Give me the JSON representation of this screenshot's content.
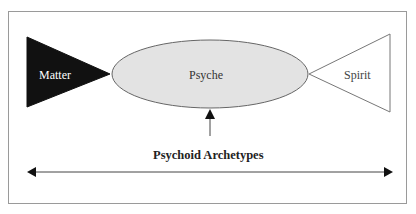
{
  "diagram": {
    "nodes": {
      "matter": {
        "label": "Matter",
        "shape": "triangle-right-pointing",
        "fill": "#111111"
      },
      "psyche": {
        "label": "Psyche",
        "shape": "ellipse",
        "fill": "#e3e3e3"
      },
      "spirit": {
        "label": "Spirit",
        "shape": "triangle-left-pointing",
        "fill": "#ffffff"
      }
    },
    "pointer_label": "Psychoid Archetypes",
    "spectrum_arrow": "double-headed-horizontal",
    "colors": {
      "border": "#9a9a9a",
      "stroke": "#555555",
      "dark": "#111111",
      "ellipse_fill": "#e3e3e3"
    }
  }
}
